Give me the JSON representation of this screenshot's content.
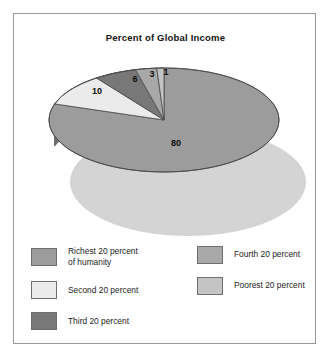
{
  "chart_data": {
    "type": "pie",
    "title": "Percent of Global Income",
    "xlabel": "",
    "ylabel": "",
    "legend_position": "bottom",
    "grid": false,
    "three_d": true,
    "units": "percent",
    "categories": [
      "Richest 20 percent of humanity",
      "Second 20 percent",
      "Third 20 percent",
      "Fourth 20 percent",
      "Poorest 20 percent"
    ],
    "values": [
      80,
      10,
      6,
      3,
      1
    ],
    "data_labels": [
      "80",
      "10",
      "6",
      "3",
      "1"
    ],
    "slice_colors": [
      "#9c9c9c",
      "#ebebeb",
      "#787878",
      "#a8a8a8",
      "#c4c4c4"
    ],
    "slices": [
      {
        "label": "Richest 20 percent of humanity",
        "value": 80,
        "data_label": "80",
        "color": "#9c9c9c"
      },
      {
        "label": "Second 20 percent",
        "value": 10,
        "data_label": "10",
        "color": "#ebebeb"
      },
      {
        "label": "Third 20 percent",
        "value": 6,
        "data_label": "6",
        "color": "#787878"
      },
      {
        "label": "Fourth 20 percent",
        "value": 3,
        "data_label": "3",
        "color": "#a8a8a8"
      },
      {
        "label": "Poorest 20 percent",
        "value": 1,
        "data_label": "1",
        "color": "#c4c4c4"
      }
    ]
  },
  "title": "Percent of Global Income",
  "slice_labels": {
    "richest": "80",
    "second": "10",
    "third": "6",
    "fourth": "3",
    "poorest": "1"
  },
  "legend": {
    "left": [
      {
        "line1": "Richest 20 percent",
        "line2": "of humanity",
        "color": "#9c9c9c"
      },
      {
        "line1": "Second 20 percent",
        "line2": "",
        "color": "#ebebeb"
      },
      {
        "line1": "Third 20 percent",
        "line2": "",
        "color": "#787878"
      }
    ],
    "right": [
      {
        "line1": "Fourth 20 percent",
        "line2": "",
        "color": "#a8a8a8"
      },
      {
        "line1": "Poorest 20 percent",
        "line2": "",
        "color": "#c4c4c4"
      }
    ]
  },
  "colors": {
    "frame": "#9a9a9a",
    "background": "#ffffff",
    "pie_top_main": "#9c9c9c",
    "pie_side_main": "#6f6f6f",
    "shadow": "#d2d2d2",
    "outline": "#4a4a4a"
  }
}
